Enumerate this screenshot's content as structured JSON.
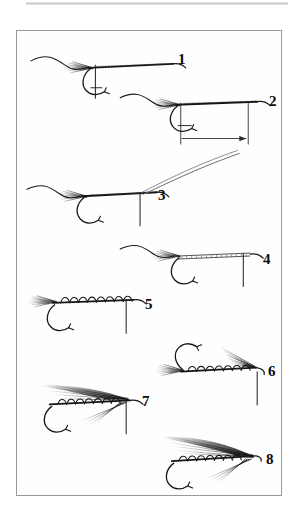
{
  "plate": {
    "title": "Fly tying step sequence",
    "subject": "wet fly / streamer tying sequence",
    "background_color": "#fefefe",
    "page_color": "#ffffff",
    "border_color": "#9a9a9a",
    "ink_color": "#111111",
    "step_count": 8,
    "scan_artifact": "gray scan band along top edge"
  },
  "steps": [
    {
      "number": "1",
      "label_x": 177,
      "label_y": 58,
      "caption": "Hook in vise, thread started and tag of material tied along shank, bobbin hanging",
      "hook_orientation": "point-down",
      "body_style": "thread-wrap",
      "has_bobbin_thread": true,
      "has_dimension_arrow": false
    },
    {
      "number": "2",
      "label_x": 268,
      "label_y": 100,
      "caption": "Body length measured from tie-in point to thread position, shown by dimension arrow",
      "hook_orientation": "point-down",
      "body_style": "thread-wrap",
      "has_bobbin_thread": true,
      "has_dimension_arrow": true
    },
    {
      "number": "3",
      "label_x": 157,
      "label_y": 194,
      "caption": "Tinsel or floss tied in at the head, material sweeping up and back to the right",
      "hook_orientation": "point-down",
      "body_style": "thread-wrap",
      "has_bobbin_thread": true,
      "has_dimension_arrow": false
    },
    {
      "number": "4",
      "label_x": 262,
      "label_y": 268,
      "caption": "Flat tinsel body wound smoothly along the shank",
      "hook_orientation": "point-down",
      "body_style": "flat-tinsel",
      "has_bobbin_thread": true,
      "has_dimension_arrow": false
    },
    {
      "number": "5",
      "label_x": 144,
      "label_y": 303,
      "caption": "Oval tinsel rib wound in open spirals over the body",
      "hook_orientation": "point-down",
      "body_style": "ribbed",
      "has_bobbin_thread": true,
      "has_dimension_arrow": false
    },
    {
      "number": "6",
      "label_x": 267,
      "label_y": 362,
      "caption": "Fly inverted in vise, throat hackle fibers tied in beneath the shank",
      "hook_orientation": "point-up",
      "body_style": "ribbed",
      "has_bobbin_thread": true,
      "has_dimension_arrow": false
    },
    {
      "number": "7",
      "label_x": 141,
      "label_y": 396,
      "caption": "Fly righted, throat and underwing fibers set, wing slips prepared",
      "hook_orientation": "point-down",
      "body_style": "ribbed",
      "has_bobbin_thread": true,
      "has_dimension_arrow": false
    },
    {
      "number": "8",
      "label_x": 265,
      "label_y": 453,
      "caption": "Finished fly with full wing set over the body and head whip finished",
      "hook_orientation": "point-down",
      "body_style": "ribbed",
      "has_bobbin_thread": false,
      "has_dimension_arrow": false
    }
  ]
}
